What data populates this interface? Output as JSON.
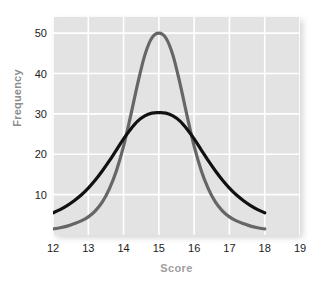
{
  "chart_data": {
    "type": "line",
    "title": "",
    "subtitle": "",
    "xlabel": "Score",
    "ylabel": "Frequency",
    "xlim": [
      12,
      19
    ],
    "ylim": [
      0,
      54
    ],
    "xticks": [
      12,
      13,
      14,
      15,
      16,
      17,
      18,
      19
    ],
    "yticks": [
      10,
      20,
      30,
      40,
      50
    ],
    "xtick_labels": [
      "12",
      "13",
      "14",
      "15",
      "16",
      "17",
      "18",
      "19"
    ],
    "ytick_labels": [
      "10",
      "20",
      "30",
      "40",
      "50"
    ],
    "grid": true,
    "grid_color": "#ffffff",
    "plot_background": "#e3e3e3",
    "legend": null,
    "legend_position": "none",
    "series": [
      {
        "name": "narrow-distribution",
        "color": "#666666",
        "line_width": 3.2,
        "x": [
          12.0,
          12.2,
          12.4,
          12.6,
          12.8,
          13.0,
          13.2,
          13.4,
          13.6,
          13.8,
          14.0,
          14.2,
          14.4,
          14.6,
          14.8,
          15.0,
          15.2,
          15.4,
          15.6,
          15.8,
          16.0,
          16.2,
          16.4,
          16.6,
          16.8,
          17.0,
          17.2,
          17.4,
          17.6,
          17.8,
          18.0
        ],
        "values": [
          1.5,
          1.8,
          2.2,
          2.8,
          3.5,
          4.5,
          6.0,
          8.2,
          11.5,
          16.0,
          22.0,
          29.5,
          37.5,
          44.5,
          48.8,
          50.0,
          48.8,
          44.5,
          37.5,
          29.5,
          22.0,
          16.0,
          11.5,
          8.2,
          6.0,
          4.5,
          3.5,
          2.8,
          2.2,
          1.8,
          1.5
        ]
      },
      {
        "name": "wide-distribution",
        "color": "#111111",
        "line_width": 3.2,
        "x": [
          12.0,
          12.2,
          12.4,
          12.6,
          12.8,
          13.0,
          13.2,
          13.4,
          13.6,
          13.8,
          14.0,
          14.2,
          14.4,
          14.6,
          14.8,
          15.0,
          15.2,
          15.4,
          15.6,
          15.8,
          16.0,
          16.2,
          16.4,
          16.6,
          16.8,
          17.0,
          17.2,
          17.4,
          17.6,
          17.8,
          18.0
        ],
        "values": [
          5.5,
          6.3,
          7.3,
          8.5,
          9.9,
          11.6,
          13.6,
          15.9,
          18.4,
          21.1,
          23.8,
          26.2,
          28.2,
          29.5,
          30.2,
          30.3,
          30.2,
          29.5,
          28.2,
          26.2,
          23.8,
          21.1,
          18.4,
          15.9,
          13.6,
          11.6,
          9.9,
          8.5,
          7.3,
          6.3,
          5.5
        ]
      }
    ],
    "annotations": [
      {
        "text": "peak of narrow curve",
        "x": 15,
        "y": 50
      },
      {
        "text": "peak of wide curve",
        "x": 15,
        "y": 30
      },
      {
        "text": "curves cross",
        "x": 14.2,
        "y": 21
      },
      {
        "text": "curves cross",
        "x": 15.8,
        "y": 21
      }
    ]
  }
}
